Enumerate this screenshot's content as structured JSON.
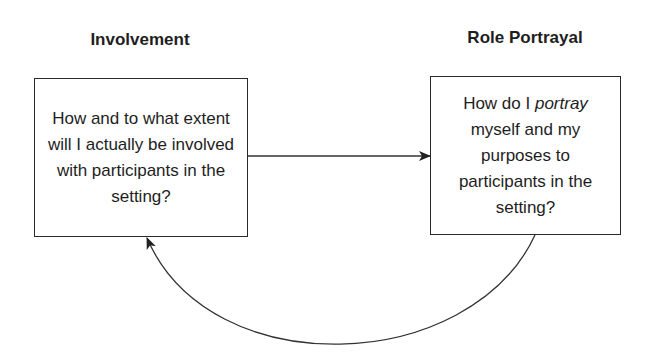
{
  "diagram": {
    "nodes": [
      {
        "id": "involvement",
        "heading": "Involvement",
        "text": "How and to what extent will I actually be involved with participants in the setting?"
      },
      {
        "id": "role-portrayal",
        "heading": "Role Portrayal",
        "text_before": "How do I ",
        "text_emphasis": "portray",
        "text_after": " myself and my purposes to participants in the setting?"
      }
    ],
    "edges": [
      {
        "from": "involvement",
        "to": "role-portrayal",
        "style": "straight arrow"
      },
      {
        "from": "role-portrayal",
        "to": "involvement",
        "style": "curved arrow (below)"
      }
    ]
  }
}
